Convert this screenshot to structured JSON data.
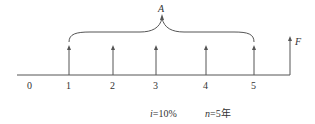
{
  "diagram": {
    "type": "cash-flow-timeline",
    "annuity_label": "A",
    "future_value_label": "F",
    "axis": {
      "periods": [
        "0",
        "1",
        "2",
        "3",
        "4",
        "5"
      ]
    },
    "annuity_payments_at_periods": [
      "1",
      "2",
      "3",
      "4",
      "5"
    ],
    "future_value_at_period": "5",
    "parameters": {
      "interest_rate_var": "i",
      "interest_rate_value": "=10%",
      "periods_var": "n",
      "periods_value": "=5年"
    },
    "colors": {
      "line": "#555555",
      "text": "#333333",
      "background": "#ffffff"
    }
  }
}
